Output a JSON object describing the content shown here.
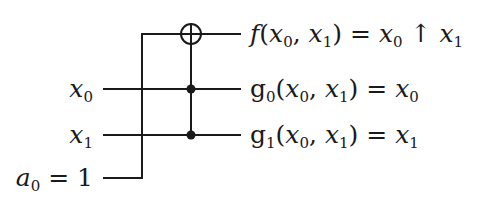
{
  "diagram": {
    "type": "reversible-circuit",
    "gate": "Toffoli",
    "colors": {
      "line": "#1a1a1a",
      "background": "#ffffff"
    },
    "inputs": [
      {
        "id": "x0",
        "var": "x",
        "sub": "0",
        "suffix": ""
      },
      {
        "id": "x1",
        "var": "x",
        "sub": "1",
        "suffix": ""
      },
      {
        "id": "a0",
        "var": "a",
        "sub": "0",
        "suffix": " = 1"
      }
    ],
    "outputs": [
      {
        "id": "f",
        "text": "f(x0, x1) = x0 ↑ x1",
        "fn": "f",
        "rhs_op": "↑"
      },
      {
        "id": "g0",
        "text": "g0(x0, x1) = x0",
        "fn": "g",
        "fn_sub": "0"
      },
      {
        "id": "g1",
        "text": "g1(x0, x1) = x1",
        "fn": "g",
        "fn_sub": "1"
      }
    ],
    "symbols": {
      "target": "xor-target (⊕)",
      "controls": [
        "x0",
        "x1"
      ],
      "equals": "=",
      "comma": ",",
      "open_paren": "(",
      "close_paren": ")",
      "nand_arrow": "↑"
    }
  }
}
